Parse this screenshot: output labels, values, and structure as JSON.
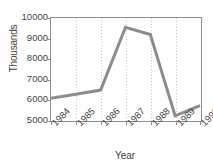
{
  "chart_data": {
    "type": "line",
    "title": "",
    "subtitle": "",
    "xlabel": "Year",
    "ylabel": "Thousands",
    "categories": [
      "1984",
      "1985",
      "1986",
      "1987",
      "1988",
      "1989",
      "1990"
    ],
    "x": [
      1984,
      1985,
      1986,
      1987,
      1988,
      1989,
      1990
    ],
    "values": [
      6100,
      6300,
      6500,
      9550,
      9200,
      5250,
      5750
    ],
    "series": [
      {
        "name": "",
        "values": [
          6100,
          6300,
          6500,
          9550,
          9200,
          5250,
          5750
        ],
        "color": "#8c8c8c"
      }
    ],
    "ylim": [
      5000,
      10000
    ],
    "y_ticks": [
      5000,
      6000,
      7000,
      8000,
      9000,
      10000
    ],
    "y_tick_labels": [
      "5000",
      "6000",
      "7000",
      "8000",
      "9000",
      "10000"
    ],
    "x_tick_labels": [
      "1984",
      "1985",
      "1986",
      "1987",
      "1988",
      "1989",
      "1990"
    ],
    "x_tick_label_rotation": -45,
    "grid": "vertical-dotted",
    "legend": "none",
    "annotations": []
  },
  "axes": {
    "y_title": "Thousands",
    "x_title": "Year",
    "frame_color": "#8f8f8f",
    "grid_color": "#c9c9c9",
    "line_color": "#8c8c8c",
    "background": "#ffffff"
  }
}
